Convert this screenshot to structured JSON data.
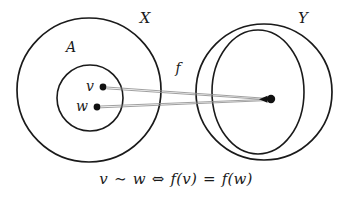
{
  "figure": {
    "type": "set-mapping-diagram",
    "background_color": "#ffffff",
    "ink_color": "#1a1a1a",
    "map_line_color": "#8f8f8f",
    "caption": "v ∼ w ⇔ f(v) = f(w)",
    "caption_parts": {
      "left_elem": "v",
      "relation": "∼",
      "right_elem": "w",
      "iff": "⇔",
      "image_left": "f(v)",
      "equals": "=",
      "image_right": "f(w)"
    }
  },
  "labels": {
    "domain_set": "X",
    "subset": "A",
    "map": "f",
    "codomain_set": "Y",
    "point_v": "v",
    "point_w": "w"
  },
  "shapes": {
    "domain_circle": {
      "cx": 89,
      "cy": 90,
      "r": 72
    },
    "subset_circle": {
      "cx": 90,
      "cy": 98,
      "r": 33
    },
    "codomain_circle": {
      "cx": 264,
      "cy": 92,
      "r": 68
    },
    "fiber_ellipse": {
      "cx": 258,
      "cy": 92,
      "rx": 46,
      "ry": 62
    }
  },
  "points": {
    "v": {
      "x": 103,
      "y": 87,
      "r": 3.4
    },
    "w": {
      "x": 97,
      "y": 107,
      "r": 3.4
    },
    "image": {
      "x": 271,
      "y": 99,
      "r": 4.2
    }
  },
  "label_positions": {
    "domain_set": {
      "x": 145,
      "y": 19
    },
    "subset": {
      "x": 71,
      "y": 48
    },
    "map": {
      "x": 178,
      "y": 69
    },
    "codomain_set": {
      "x": 303,
      "y": 19
    },
    "point_v": {
      "x": 90,
      "y": 87
    },
    "point_w": {
      "x": 82,
      "y": 107
    }
  }
}
